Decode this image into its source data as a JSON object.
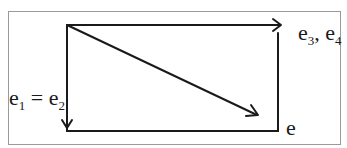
{
  "diagram": {
    "colors": {
      "stroke": "#1a1a1a",
      "frame": "#9a9a9a",
      "background": "#ffffff"
    },
    "labels": {
      "top_right": {
        "parts": [
          {
            "base": "e",
            "sub": "3"
          },
          {
            "sep": ", "
          },
          {
            "base": "e",
            "sub": "4"
          }
        ]
      },
      "left": {
        "parts": [
          {
            "base": "e",
            "sub": "1"
          },
          {
            "sep": " = "
          },
          {
            "base": "e",
            "sub": "2"
          }
        ]
      },
      "bottom_right": {
        "text": "e"
      }
    },
    "label_text": {
      "e34_e1": "e",
      "e34_s1": "3",
      "e34_sep": ", ",
      "e34_e2": "e",
      "e34_s2": "4",
      "e12_e1": "e",
      "e12_s1": "1",
      "e12_sep": " = ",
      "e12_e2": "e",
      "e12_s2": "2",
      "e_bottom": "e"
    },
    "edges": [
      {
        "name": "top-arrow",
        "from": [
          67,
          25
        ],
        "to": [
          281,
          25
        ],
        "arrow": true
      },
      {
        "name": "left-down-arrow",
        "from": [
          67,
          25
        ],
        "to": [
          67,
          131
        ],
        "arrow": true
      },
      {
        "name": "diagonal-arrow",
        "from": [
          67,
          25
        ],
        "to": [
          258,
          115
        ],
        "arrow": true
      },
      {
        "name": "right-side",
        "from": [
          278,
          33
        ],
        "to": [
          278,
          131
        ],
        "arrow": false
      },
      {
        "name": "bottom-side",
        "from": [
          67,
          131
        ],
        "to": [
          278,
          131
        ],
        "arrow": false
      }
    ]
  }
}
